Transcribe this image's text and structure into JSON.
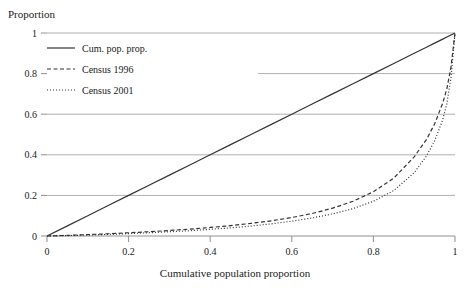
{
  "chart_data": {
    "type": "line",
    "title": "",
    "xlabel": "Cumulative population proportion",
    "ylabel": "Proportion",
    "xlim": [
      0,
      1
    ],
    "ylim": [
      0,
      1
    ],
    "xticks": [
      "0",
      "0.2",
      "0.4",
      "0.6",
      "0.8",
      "1"
    ],
    "xtick_values": [
      0,
      0.2,
      0.4,
      0.6,
      0.8,
      1
    ],
    "yticks": [
      "0",
      "0.2",
      "0.4",
      "0.6",
      "0.8",
      "1"
    ],
    "ytick_values": [
      0,
      0.2,
      0.4,
      0.6,
      0.8,
      1
    ],
    "grid": "horizontal",
    "legend_position": "top-left",
    "x": [
      0,
      0.05,
      0.1,
      0.15,
      0.2,
      0.25,
      0.3,
      0.35,
      0.4,
      0.45,
      0.5,
      0.55,
      0.6,
      0.65,
      0.7,
      0.75,
      0.8,
      0.85,
      0.9,
      0.93,
      0.95,
      0.97,
      0.98,
      0.99,
      1
    ],
    "series": [
      {
        "name": "Cum. pop. prop.",
        "style": "solid",
        "color": "#333333",
        "values": [
          0,
          0.05,
          0.1,
          0.15,
          0.2,
          0.25,
          0.3,
          0.35,
          0.4,
          0.45,
          0.5,
          0.55,
          0.6,
          0.65,
          0.7,
          0.75,
          0.8,
          0.85,
          0.9,
          0.93,
          0.95,
          0.97,
          0.98,
          0.99,
          1
        ]
      },
      {
        "name": "Census 1996",
        "style": "dashed",
        "color": "#333333",
        "values": [
          0,
          0.003,
          0.007,
          0.011,
          0.016,
          0.021,
          0.027,
          0.034,
          0.042,
          0.051,
          0.062,
          0.075,
          0.091,
          0.111,
          0.137,
          0.171,
          0.218,
          0.285,
          0.39,
          0.475,
          0.552,
          0.655,
          0.725,
          0.83,
          1
        ]
      },
      {
        "name": "Census 2001",
        "style": "dotted",
        "color": "#333333",
        "values": [
          0,
          0.002,
          0.005,
          0.008,
          0.012,
          0.016,
          0.021,
          0.026,
          0.033,
          0.04,
          0.049,
          0.06,
          0.073,
          0.089,
          0.109,
          0.135,
          0.171,
          0.224,
          0.312,
          0.394,
          0.468,
          0.573,
          0.652,
          0.778,
          1
        ]
      }
    ]
  },
  "legend": {
    "items": [
      {
        "label": "Cum. pop. prop.",
        "style": "solid"
      },
      {
        "label": "Census 1996",
        "style": "dashed"
      },
      {
        "label": "Census 2001",
        "style": "dotted"
      }
    ]
  },
  "colors": {
    "grid": "#b0b0b0",
    "axis": "#909090",
    "line": "#333333",
    "text": "#1a1a1a",
    "background": "#ffffff"
  }
}
